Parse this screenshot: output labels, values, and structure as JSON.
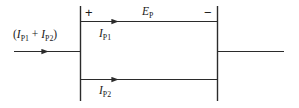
{
  "diagram": {
    "stroke_color": "#2b2b2b",
    "background_color": "#ffffff",
    "labels": {
      "input_current": "(IP1 + IP2)",
      "input_current_main_1": "(",
      "input_current_var_1": "I",
      "input_current_sub_1": "P1",
      "input_current_op": " + ",
      "input_current_var_2": "I",
      "input_current_sub_2": "P2",
      "input_current_close": ")",
      "emf_var": "E",
      "emf_sub": "P",
      "branch1_var": "I",
      "branch1_sub": "P1",
      "branch2_var": "I",
      "branch2_sub": "P2",
      "polarity_positive": "+",
      "polarity_negative": "−"
    }
  }
}
